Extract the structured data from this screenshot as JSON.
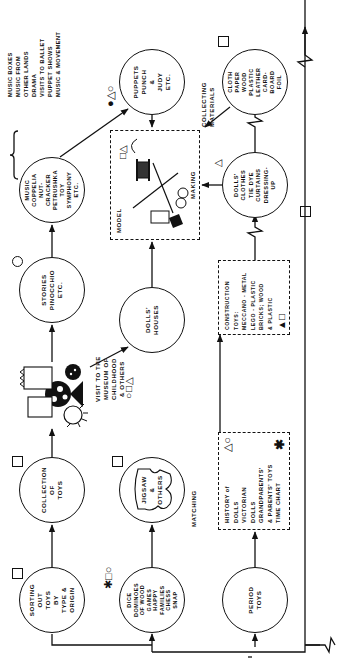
{
  "diagram": {
    "orientation": "rotated 90 degrees",
    "nodes": {
      "sorting": {
        "text": "SORTING\nOUT\nTOYS\nBY\nTYPE &\nORIGIN",
        "symbols": [
          "square"
        ]
      },
      "collection": {
        "text": "COLLECTION\nOF\nTOYS",
        "symbols": [
          "square"
        ]
      },
      "visit": {
        "text": "VISIT TO THE\nMUSEUM OF CHILDHOOD\n& OTHERS",
        "symbols": [
          "circle",
          "square",
          "triangle"
        ]
      },
      "stories": {
        "text": "STORIES\nPINOCCHIO\nETC.",
        "symbols": [
          "circle"
        ]
      },
      "music": {
        "text": "MUSIC\nCOPPELIA\nNUT-\nCRACKER\nPETRUSHKA\nTOY\nSYMPHONY\nETC.",
        "symbols": []
      },
      "music_list": {
        "lines": [
          "MUSIC BOXES",
          "MUSIC FROM",
          "OTHER LANDS",
          "DRAMA",
          "VISITS TO BALLET",
          "PUPPET SHOWS",
          "MUSIC & MOVEMENT"
        ]
      },
      "puppets": {
        "text": "PUPPETS\nPUNCH\n&\nJUDY\nETC.",
        "symbols": [
          "filled-circle",
          "triangle",
          "circle"
        ]
      },
      "dice": {
        "text": "DICE\nDOMINOES\nOF WOOD\nGAMES\nHAPPY\nFAMILIES\nCHESS\nSNAP",
        "symbols": [
          "asterisk",
          "square",
          "circle"
        ]
      },
      "jigsaw": {
        "text": "JIGSAW\n&\nOTHERS",
        "symbols": [
          "square"
        ]
      },
      "dolls_houses": {
        "text": "DOLLS'\nHOUSES",
        "symbols": []
      },
      "model_making": {
        "label_left": "MODEL",
        "label_right": "MAKING",
        "symbols": [
          "square",
          "triangle"
        ]
      },
      "collecting_materials": {
        "label": "COLLECTING\nMATERIALS"
      },
      "cloth": {
        "text": "CLOTH\nPAPER\nWOOD\nPLASTIC\nLEATHER\nCARD-\nBOARD\nFOIL",
        "symbols": [
          "square"
        ]
      },
      "dolls_clothes": {
        "text": "DOLLS'\nCLOTHES\nTIE DYE\nCURTAINS\nDRESSING-\nUP",
        "symbols": [
          "triangle",
          "square"
        ]
      },
      "construction": {
        "text": "CONSTRUCTION\nTOYS:\nMECCANO - METAL\nLEGO - PLASTIC\nBRICKS; WOOD\n& PLASTIC",
        "symbols": [
          "filled-triangle",
          "square"
        ]
      },
      "history": {
        "text": "HISTORY of\nDOLLS\nVICTORIAN\nDOLLS\nGRANDPARENTS'\n& PARENTS' TOYS\nTIME CHART",
        "symbols": [
          "triangle",
          "circle",
          "asterisk"
        ]
      },
      "period": {
        "text": "PERIOD\nTOYS"
      },
      "matching": {
        "label": "MATCHING"
      }
    }
  }
}
